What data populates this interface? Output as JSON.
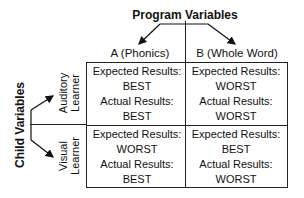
{
  "diagram": {
    "top_label": "Program Variables",
    "left_label": "Child Variables",
    "columns": [
      {
        "label": "A (Phonics)"
      },
      {
        "label": "B (Whole Word)"
      }
    ],
    "rows": [
      {
        "label_line1": "Auditory",
        "label_line2": "Learner"
      },
      {
        "label_line1": "Visual",
        "label_line2": "Learner"
      }
    ],
    "cells": [
      [
        {
          "expected_label": "Expected Results:",
          "expected": "BEST",
          "actual_label": "Actual Results:",
          "actual": "BEST"
        },
        {
          "expected_label": "Expected Results:",
          "expected": "WORST",
          "actual_label": "Actual Results:",
          "actual": "WORST"
        }
      ],
      [
        {
          "expected_label": "Expected Results:",
          "expected": "WORST",
          "actual_label": "Actual Results:",
          "actual": "BEST"
        },
        {
          "expected_label": "Expected Results:",
          "expected": "BEST",
          "actual_label": "Actual Results:",
          "actual": "WORST"
        }
      ]
    ],
    "line_color": "#222222"
  }
}
